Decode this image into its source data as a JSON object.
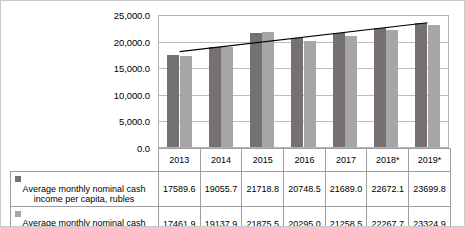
{
  "chart_data": {
    "type": "bar",
    "title": "",
    "xlabel": "",
    "ylabel": "",
    "categories": [
      "2013",
      "2014",
      "2015",
      "2016",
      "2017",
      "2018*",
      "2019*"
    ],
    "series": [
      {
        "name": "Average monthly nominal cash income per capita, rubles",
        "color": "#767171",
        "values": [
          17589.6,
          19055.7,
          21718.8,
          20748.5,
          21689.0,
          22672.1,
          23699.8
        ]
      },
      {
        "name": "Average monthly nominal cash expenditures per capita, rubles",
        "color": "#a6a6a6",
        "values": [
          17461.9,
          19137.9,
          21875.5,
          20295.0,
          21258.5,
          22267.7,
          23324.9
        ]
      }
    ],
    "value_labels": [
      [
        "17589.6",
        "19055.7",
        "21718.8",
        "20748.5",
        "21689.0",
        "22672.1",
        "23699.8"
      ],
      [
        "17461.9",
        "19137.9",
        "21875.5",
        "20295.0",
        "21258.5",
        "22267.7",
        "23324.9"
      ]
    ],
    "ylim": [
      0,
      25000
    ],
    "yticks": [
      0,
      5000,
      10000,
      15000,
      20000,
      25000
    ],
    "ytick_labels": [
      "0.0",
      "5,000.0",
      "10,000.0",
      "15,000.0",
      "20,000.0",
      "25,000.0"
    ],
    "grid": true,
    "legend_position": "bottom-table",
    "trendline": {
      "name": "linear trend",
      "color": "#000000",
      "start_value": 18200,
      "end_value": 23700
    }
  },
  "legend": {
    "series_0_line1": "Average monthly nominal cash",
    "series_0_line2": "income per capita, rubles",
    "series_1_line1": "Average monthly nominal cash",
    "series_1_line2": "expenditures per capita, rubles"
  }
}
